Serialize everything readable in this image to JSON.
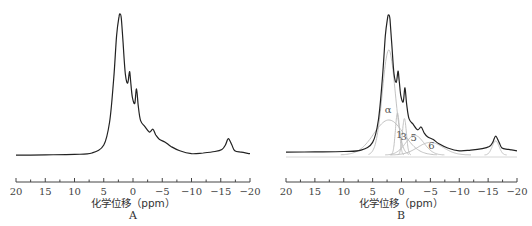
{
  "chart_data": [
    {
      "type": "line",
      "panel_label": "A",
      "title": "",
      "xlabel": "化学位移（ppm）",
      "ylabel": "",
      "xlim": [
        20,
        -20
      ],
      "x_ticks": [
        20,
        15,
        10,
        5,
        0,
        -5,
        -10,
        -15,
        -20
      ],
      "x_tick_labels": [
        "20",
        "15",
        "10",
        "5",
        "0",
        "−5",
        "−10",
        "−15",
        "−20"
      ],
      "grid": false,
      "series": [
        {
          "name": "spectrum",
          "color": "#222222",
          "x": [
            20,
            15,
            10,
            7,
            5,
            4,
            3.3,
            2.8,
            2.4,
            2.2,
            2.0,
            1.7,
            1.3,
            0.9,
            0.6,
            0.4,
            0.1,
            -0.3,
            -0.6,
            -0.9,
            -1.3,
            -2,
            -2.8,
            -3.4,
            -3.9,
            -4.5,
            -5.5,
            -6.5,
            -8,
            -10,
            -12,
            -14,
            -15.2,
            -15.8,
            -16.3,
            -16.9,
            -17.4,
            -18.5,
            -20
          ],
          "y": [
            0.02,
            0.022,
            0.025,
            0.035,
            0.09,
            0.25,
            0.55,
            0.85,
            0.98,
            1.0,
            0.97,
            0.8,
            0.58,
            0.52,
            0.6,
            0.53,
            0.42,
            0.38,
            0.48,
            0.36,
            0.26,
            0.22,
            0.18,
            0.2,
            0.16,
            0.13,
            0.11,
            0.08,
            0.05,
            0.03,
            0.035,
            0.045,
            0.06,
            0.09,
            0.135,
            0.09,
            0.05,
            0.04,
            0.03
          ]
        }
      ]
    },
    {
      "type": "line",
      "panel_label": "B",
      "title": "",
      "xlabel": "化学位移（ppm）",
      "ylabel": "",
      "xlim": [
        20,
        -20
      ],
      "x_ticks": [
        20,
        15,
        10,
        5,
        0,
        -5,
        -10,
        -15,
        -20
      ],
      "x_tick_labels": [
        "20",
        "15",
        "10",
        "5",
        "0",
        "−5",
        "−10",
        "−15",
        "−20"
      ],
      "grid": false,
      "annotations": [
        {
          "text": "α",
          "x": 2.3,
          "y": 0.3
        },
        {
          "text": "1",
          "x": 0.4,
          "y": 0.12
        },
        {
          "text": "3",
          "x": -0.4,
          "y": 0.11
        },
        {
          "text": "5",
          "x": -2.1,
          "y": 0.1
        },
        {
          "text": "6",
          "x": -5.2,
          "y": 0.04
        }
      ],
      "series": [
        {
          "name": "spectrum",
          "color": "#222222",
          "x": [
            20,
            15,
            10,
            7,
            5,
            4,
            3.3,
            2.8,
            2.4,
            2.2,
            2.0,
            1.7,
            1.3,
            0.9,
            0.6,
            0.4,
            0.1,
            -0.3,
            -0.6,
            -0.9,
            -1.3,
            -2,
            -2.8,
            -3.4,
            -3.9,
            -4.5,
            -5.5,
            -6.5,
            -8,
            -10,
            -12,
            -14,
            -15.2,
            -15.8,
            -16.3,
            -16.9,
            -17.4,
            -18.5,
            -20
          ],
          "y": [
            0.02,
            0.022,
            0.025,
            0.035,
            0.09,
            0.25,
            0.55,
            0.85,
            0.98,
            1.0,
            0.97,
            0.8,
            0.58,
            0.52,
            0.6,
            0.53,
            0.42,
            0.38,
            0.48,
            0.36,
            0.26,
            0.22,
            0.18,
            0.2,
            0.16,
            0.13,
            0.11,
            0.08,
            0.05,
            0.03,
            0.035,
            0.045,
            0.06,
            0.09,
            0.135,
            0.09,
            0.05,
            0.04,
            0.03
          ]
        },
        {
          "name": "component-main",
          "color": "#bbbbbb",
          "center": 2.2,
          "width": 1.1,
          "height": 0.75
        },
        {
          "name": "component-alpha",
          "color": "#bbbbbb",
          "center": 2.2,
          "width": 2.6,
          "height": 0.25
        },
        {
          "name": "component-1",
          "color": "#bbbbbb",
          "center": 0.7,
          "width": 0.35,
          "height": 0.3
        },
        {
          "name": "component-3",
          "color": "#bbbbbb",
          "center": -0.5,
          "width": 0.35,
          "height": 0.26
        },
        {
          "name": "component-5",
          "color": "#bbbbbb",
          "center": -2.3,
          "width": 1.6,
          "height": 0.14
        },
        {
          "name": "component-6",
          "color": "#bbbbbb",
          "center": -5.0,
          "width": 2.2,
          "height": 0.09
        },
        {
          "name": "component-16",
          "color": "#bbbbbb",
          "center": -16.3,
          "width": 0.6,
          "height": 0.1
        }
      ]
    }
  ]
}
